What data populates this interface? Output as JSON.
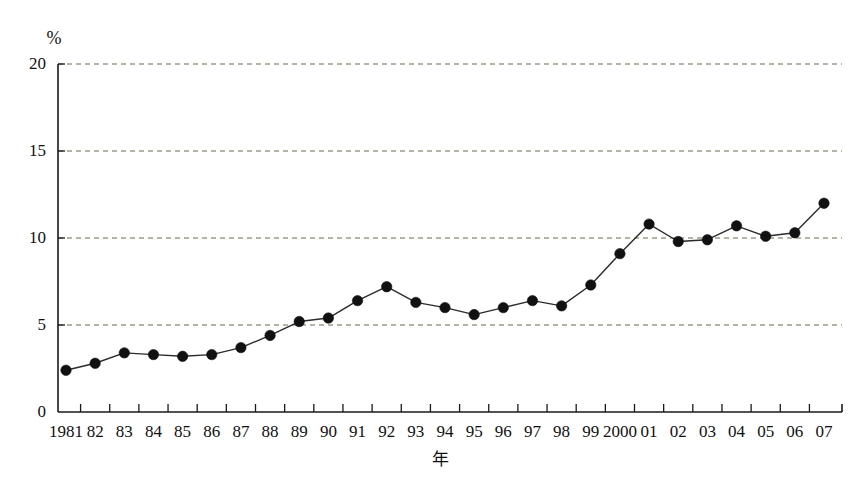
{
  "chart_data": {
    "type": "line",
    "title": "",
    "subtitle": "",
    "xlabel": "年",
    "ylabel": "%",
    "unit_label": "%",
    "categories": [
      "1981",
      "82",
      "83",
      "84",
      "85",
      "86",
      "87",
      "88",
      "89",
      "90",
      "91",
      "92",
      "93",
      "94",
      "95",
      "96",
      "97",
      "98",
      "99",
      "2000",
      "01",
      "02",
      "03",
      "04",
      "05",
      "06",
      "07"
    ],
    "values": [
      2.4,
      2.8,
      3.4,
      3.3,
      3.2,
      3.3,
      3.7,
      4.4,
      5.2,
      5.4,
      6.4,
      7.2,
      6.3,
      6.0,
      5.6,
      6.0,
      6.4,
      6.1,
      7.3,
      9.1,
      10.8,
      9.8,
      9.9,
      10.7,
      10.1,
      10.3,
      12.0
    ],
    "series": [
      {
        "name": "",
        "values": [
          2.4,
          2.8,
          3.4,
          3.3,
          3.2,
          3.3,
          3.7,
          4.4,
          5.2,
          5.4,
          6.4,
          7.2,
          6.3,
          6.0,
          5.6,
          6.0,
          6.4,
          6.1,
          7.3,
          9.1,
          10.8,
          9.8,
          9.9,
          10.7,
          10.1,
          10.3,
          12.0
        ]
      }
    ],
    "ylim": [
      0,
      20
    ],
    "yticks": [
      0,
      5,
      10,
      15,
      20
    ],
    "ytick_labels": [
      "0",
      "5",
      "10",
      "15",
      "20"
    ],
    "grid": true,
    "grid_axis": "y",
    "legend": false,
    "legend_position": "none",
    "marker": "filled-circle",
    "line_color": "#2b2b2b",
    "marker_color": "#111111",
    "grid_color": "#6b6b4a",
    "background_color": "#ffffff",
    "annotations": []
  },
  "axes": {
    "y_unit": "%",
    "x_title": "年"
  }
}
